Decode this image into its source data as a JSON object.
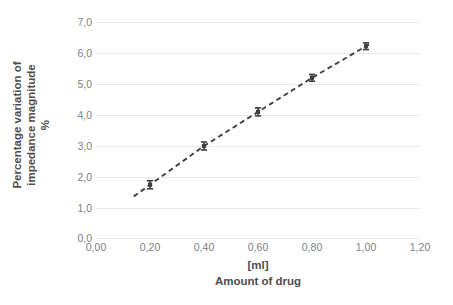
{
  "chart_data": {
    "type": "scatter",
    "title": "",
    "xlabel": "Amount of drug",
    "xlabel_unit": "[ml]",
    "ylabel_lines": [
      "Percentage variation of",
      "impedance magnitude",
      "%"
    ],
    "ylabel": "Percentage variation of impedance magnitude %",
    "xlim": [
      0.0,
      1.2
    ],
    "ylim": [
      0.0,
      7.0
    ],
    "xtick_values": [
      0.0,
      0.2,
      0.4,
      0.6,
      0.8,
      1.0,
      1.2
    ],
    "xtick_labels": [
      "0,00",
      "0,20",
      "0,40",
      "0,60",
      "0,80",
      "1,00",
      "1,20"
    ],
    "ytick_values": [
      0.0,
      1.0,
      2.0,
      3.0,
      4.0,
      5.0,
      6.0,
      7.0
    ],
    "ytick_labels": [
      "0,0",
      "1,0",
      "2,0",
      "3,0",
      "4,0",
      "5,0",
      "6,0",
      "7,0"
    ],
    "grid": "horizontal",
    "legend": "none",
    "decimal_separator": ",",
    "series": [
      {
        "name": "impedance variation",
        "marker": "error-bar",
        "line_style": "dashed",
        "line_color": "#404040",
        "marker_color": "#404040",
        "x": [
          0.2,
          0.4,
          0.6,
          0.8,
          1.0
        ],
        "values": [
          1.75,
          3.0,
          4.1,
          5.2,
          6.22
        ],
        "yerr": [
          0.13,
          0.13,
          0.13,
          0.11,
          0.11
        ]
      }
    ]
  },
  "colors": {
    "background": "#ffffff",
    "gridline": "#e8e8e8",
    "tick_text": "#808080",
    "axis_title_text": "#4d4d4d",
    "data": "#404040"
  }
}
